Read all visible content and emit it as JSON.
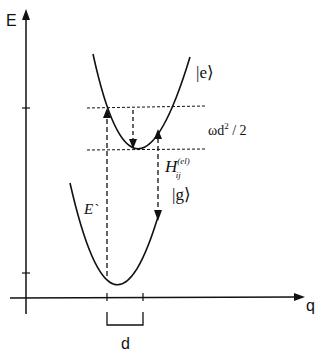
{
  "diagram": {
    "axes": {
      "y_label": "E",
      "x_label": "q"
    },
    "curves": {
      "excited_state_label": "|e⟩",
      "ground_state_label": "|g⟩"
    },
    "annotations": {
      "vertical_energy_label": "E`",
      "reorganization_label": "ωd",
      "reorganization_exponent": "2",
      "reorganization_suffix": " / 2",
      "coupling_symbol": "H",
      "coupling_superscript": "(el)",
      "coupling_subscript": "ij",
      "displacement_label": "d"
    },
    "colors": {
      "line": "#111111",
      "background": "#ffffff"
    }
  }
}
